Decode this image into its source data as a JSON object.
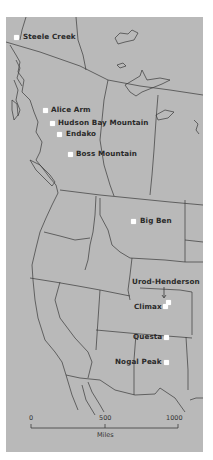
{
  "map": {
    "background_color": "#b9b9b9",
    "line_color": "#3a3a3a",
    "marker_color": "#ffffff",
    "sites": [
      {
        "name": "Steele Creek",
        "dot": [
          16,
          37
        ],
        "label": [
          23,
          33
        ]
      },
      {
        "name": "Alice Arm",
        "dot": [
          45,
          110
        ],
        "label": [
          51,
          106
        ]
      },
      {
        "name": "Hudson Bay Mountain",
        "dot": [
          52,
          123
        ],
        "label": [
          58,
          119
        ]
      },
      {
        "name": "Endako",
        "dot": [
          59,
          134
        ],
        "label": [
          66,
          130
        ]
      },
      {
        "name": "Boss Mountain",
        "dot": [
          70,
          154
        ],
        "label": [
          76,
          150
        ]
      },
      {
        "name": "Big Ben",
        "dot": [
          133,
          221
        ],
        "label": [
          140,
          217
        ]
      },
      {
        "name": "Urod-Henderson",
        "dot": null,
        "label": [
          132,
          278
        ]
      },
      {
        "name": "Climax",
        "dot": [
          164,
          302
        ],
        "label": [
          134,
          303
        ]
      },
      {
        "name": "Questa",
        "dot": [
          164,
          337
        ],
        "label": [
          133,
          333
        ]
      },
      {
        "name": "Nogal Peak",
        "dot": [
          164,
          362
        ],
        "label": [
          115,
          358
        ]
      }
    ]
  },
  "scale_bar": {
    "ticks": [
      "0",
      "500",
      "1000"
    ],
    "unit": "Miles"
  }
}
